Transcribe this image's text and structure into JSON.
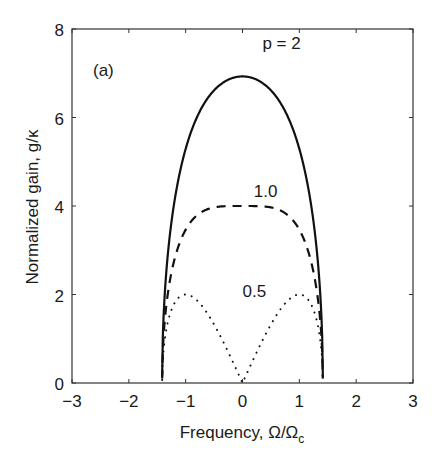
{
  "chart_data": {
    "type": "line",
    "panel_label": "(a)",
    "xlabel": "Frequency, Ω/Ω",
    "xlabel_subscript": "c",
    "ylabel": "Normalized gain, g/κ",
    "xlim": [
      -3,
      3
    ],
    "ylim": [
      0,
      8
    ],
    "xticks": [
      -3,
      -2,
      -1,
      0,
      1,
      2,
      3
    ],
    "xtick_labels": [
      "−3",
      "−2",
      "−1",
      "0",
      "1",
      "2",
      "3"
    ],
    "yticks": [
      0,
      2,
      4,
      6,
      8
    ],
    "ytick_labels": [
      "0",
      "2",
      "4",
      "6",
      "8"
    ],
    "grid": false,
    "legend": "inline annotations",
    "series": [
      {
        "name": "p = 2",
        "label": "p = 2",
        "style": "solid",
        "x": [
          -1.414,
          -1.4,
          -1.35,
          -1.3,
          -1.2,
          -1.1,
          -1.0,
          -0.8,
          -0.6,
          -0.4,
          -0.2,
          0.0,
          0.2,
          0.4,
          0.6,
          0.8,
          1.0,
          1.1,
          1.2,
          1.3,
          1.35,
          1.4,
          1.414
        ],
        "values": [
          0.0,
          0.83,
          1.78,
          2.39,
          3.29,
          4.0,
          4.9,
          5.66,
          6.22,
          6.62,
          6.86,
          6.93,
          6.86,
          6.62,
          6.22,
          5.66,
          4.9,
          4.0,
          3.29,
          2.39,
          1.78,
          0.83,
          0.0
        ]
      },
      {
        "name": "p = 1.0",
        "label": "1.0",
        "style": "dashed",
        "x": [
          -1.414,
          -1.4,
          -1.35,
          -1.3,
          -1.2,
          -1.1,
          -1.0,
          -0.8,
          -0.6,
          -0.4,
          -0.2,
          0.0,
          0.2,
          0.4,
          0.6,
          0.8,
          1.0,
          1.1,
          1.2,
          1.3,
          1.35,
          1.4,
          1.414
        ],
        "values": [
          0.0,
          0.79,
          1.69,
          2.27,
          3.13,
          3.56,
          3.46,
          3.79,
          3.93,
          3.99,
          4.0,
          4.0,
          4.0,
          3.99,
          3.93,
          3.79,
          3.46,
          3.56,
          3.13,
          2.27,
          1.69,
          0.79,
          0.0
        ]
      },
      {
        "name": "p = 0.5",
        "label": "0.5",
        "style": "dotted",
        "x": [
          -1.414,
          -1.4,
          -1.35,
          -1.3,
          -1.2,
          -1.1,
          -1.0,
          -0.9,
          -0.8,
          -0.6,
          -0.4,
          -0.2,
          0.0,
          0.2,
          0.4,
          0.6,
          0.8,
          0.9,
          1.0,
          1.1,
          1.2,
          1.3,
          1.35,
          1.4,
          1.414
        ],
        "values": [
          0.0,
          0.56,
          1.14,
          1.45,
          1.8,
          1.96,
          2.0,
          1.96,
          1.87,
          1.54,
          1.08,
          0.56,
          0.0,
          0.56,
          1.08,
          1.54,
          1.87,
          1.96,
          2.0,
          1.96,
          1.8,
          1.45,
          1.14,
          0.56,
          0.0
        ]
      }
    ],
    "annotations": [
      {
        "text": "p = 2",
        "x": 0.35,
        "y": 7.55
      },
      {
        "text": "1.0",
        "x": 0.2,
        "y": 4.2
      },
      {
        "text": "0.5",
        "x": 0.0,
        "y": 1.95
      }
    ]
  }
}
